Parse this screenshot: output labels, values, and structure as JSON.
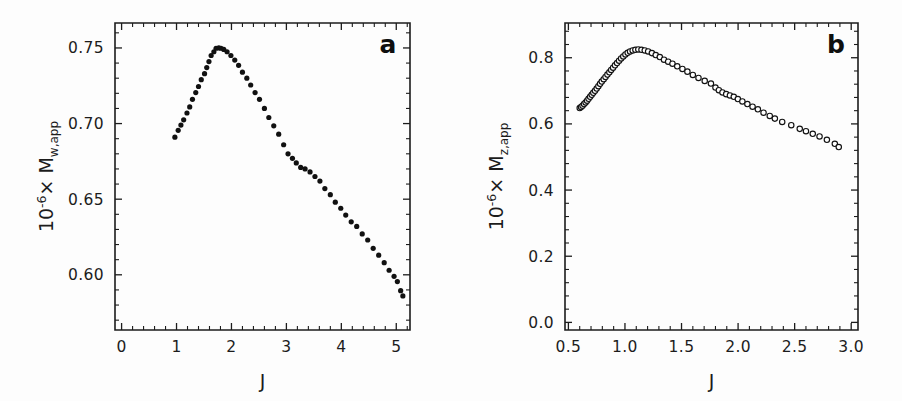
{
  "figure": {
    "background_color": "#fdfdfd",
    "foreground_color": "#1c1c1c",
    "width": 902,
    "height": 401
  },
  "panels": [
    {
      "id": "a",
      "letter": "a",
      "xlabel": "J",
      "ylabel_prefix": "10",
      "ylabel_exponent": "-6",
      "ylabel_times": "×",
      "ylabel_symbol": "M",
      "ylabel_subscript": "w,app",
      "ylabel_full": "10−6× M w,app",
      "xticklabels": [
        "0",
        "1",
        "2",
        "3",
        "4",
        "5"
      ],
      "yticklabels": [
        "0.75",
        "0.70",
        "0.65",
        "0.60"
      ],
      "marker_style": "filled-circle"
    },
    {
      "id": "b",
      "letter": "b",
      "xlabel": "J",
      "ylabel_prefix": "10",
      "ylabel_exponent": "-6",
      "ylabel_times": "×",
      "ylabel_symbol": "M",
      "ylabel_subscript": "z,app",
      "ylabel_full": "10−6× M z,app",
      "xticklabels": [
        "0.5",
        "1.0",
        "1.5",
        "2.0",
        "2.5",
        "3.0"
      ],
      "yticklabels": [
        "0.0",
        "0.2",
        "0.4",
        "0.6",
        "0.8"
      ],
      "marker_style": "open-circle"
    }
  ],
  "chart_data": [
    {
      "type": "scatter",
      "panel": "a",
      "title": "a",
      "xlabel": "J",
      "ylabel": "10^-6 x M_w,app",
      "xlim": [
        -0.12,
        5.25
      ],
      "ylim": [
        0.5635,
        0.7665
      ],
      "xticks": [
        0,
        1,
        2,
        3,
        4,
        5
      ],
      "yticks": [
        0.75,
        0.7,
        0.65,
        0.6
      ],
      "xminor_per_major": 5,
      "yminor_per_major": 5,
      "grid": false,
      "legend": null,
      "marker": "filled-circle",
      "marker_color": "#111111",
      "x": [
        0.97,
        1.03,
        1.08,
        1.13,
        1.19,
        1.24,
        1.29,
        1.35,
        1.4,
        1.45,
        1.51,
        1.55,
        1.59,
        1.63,
        1.68,
        1.72,
        1.77,
        1.81,
        1.86,
        1.92,
        1.99,
        2.06,
        2.13,
        2.2,
        2.28,
        2.35,
        2.43,
        2.51,
        2.6,
        2.68,
        2.77,
        2.86,
        2.95,
        3.03,
        3.11,
        3.18,
        3.26,
        3.34,
        3.43,
        3.52,
        3.61,
        3.7,
        3.8,
        3.89,
        3.99,
        4.08,
        4.18,
        4.28,
        4.38,
        4.48,
        4.58,
        4.68,
        4.78,
        4.87,
        4.96,
        5.02,
        5.08,
        5.12
      ],
      "y": [
        0.691,
        0.6955,
        0.699,
        0.7025,
        0.707,
        0.711,
        0.716,
        0.7205,
        0.7245,
        0.729,
        0.733,
        0.737,
        0.741,
        0.745,
        0.7475,
        0.7498,
        0.75,
        0.7498,
        0.749,
        0.7475,
        0.745,
        0.742,
        0.7385,
        0.734,
        0.73,
        0.7255,
        0.7205,
        0.716,
        0.71,
        0.704,
        0.6985,
        0.693,
        0.686,
        0.68,
        0.677,
        0.674,
        0.671,
        0.67,
        0.668,
        0.665,
        0.662,
        0.657,
        0.653,
        0.648,
        0.644,
        0.6395,
        0.635,
        0.632,
        0.627,
        0.623,
        0.6175,
        0.613,
        0.608,
        0.603,
        0.599,
        0.5955,
        0.5895,
        0.586
      ]
    },
    {
      "type": "scatter",
      "panel": "b",
      "title": "b",
      "xlabel": "J",
      "ylabel": "10^-6 x M_z,app",
      "xlim": [
        0.47,
        3.06
      ],
      "ylim": [
        -0.023,
        0.905
      ],
      "xticks": [
        0.5,
        1.0,
        1.5,
        2.0,
        2.5,
        3.0
      ],
      "yticks": [
        0.0,
        0.2,
        0.4,
        0.6,
        0.8
      ],
      "xminor_per_major": 5,
      "yminor_per_major": 5,
      "grid": false,
      "legend": null,
      "marker": "open-circle",
      "marker_color": "#121212",
      "x": [
        0.6,
        0.612,
        0.625,
        0.638,
        0.652,
        0.665,
        0.678,
        0.692,
        0.706,
        0.72,
        0.735,
        0.75,
        0.765,
        0.78,
        0.795,
        0.812,
        0.828,
        0.845,
        0.862,
        0.878,
        0.895,
        0.912,
        0.93,
        0.948,
        0.966,
        0.985,
        1.004,
        1.024,
        1.045,
        1.068,
        1.092,
        1.118,
        1.146,
        1.175,
        1.205,
        1.238,
        1.272,
        1.308,
        1.345,
        1.382,
        1.42,
        1.462,
        1.508,
        1.552,
        1.6,
        1.65,
        1.705,
        1.76,
        1.8,
        1.83,
        1.862,
        1.895,
        1.928,
        1.962,
        1.998,
        2.038,
        2.082,
        2.128,
        2.175,
        2.225,
        2.28,
        2.325,
        2.39,
        2.47,
        2.545,
        2.6,
        2.66,
        2.72,
        2.785,
        2.855,
        2.89
      ],
      "y": [
        0.648,
        0.651,
        0.655,
        0.66,
        0.665,
        0.67,
        0.676,
        0.682,
        0.688,
        0.694,
        0.7,
        0.707,
        0.714,
        0.721,
        0.728,
        0.735,
        0.742,
        0.749,
        0.756,
        0.763,
        0.77,
        0.777,
        0.784,
        0.791,
        0.798,
        0.804,
        0.81,
        0.815,
        0.819,
        0.822,
        0.824,
        0.825,
        0.824,
        0.822,
        0.819,
        0.814,
        0.808,
        0.802,
        0.794,
        0.788,
        0.782,
        0.774,
        0.766,
        0.758,
        0.748,
        0.739,
        0.73,
        0.722,
        0.71,
        0.702,
        0.695,
        0.69,
        0.686,
        0.682,
        0.675,
        0.668,
        0.66,
        0.652,
        0.644,
        0.634,
        0.624,
        0.616,
        0.606,
        0.596,
        0.585,
        0.578,
        0.57,
        0.562,
        0.552,
        0.54,
        0.53
      ]
    }
  ]
}
